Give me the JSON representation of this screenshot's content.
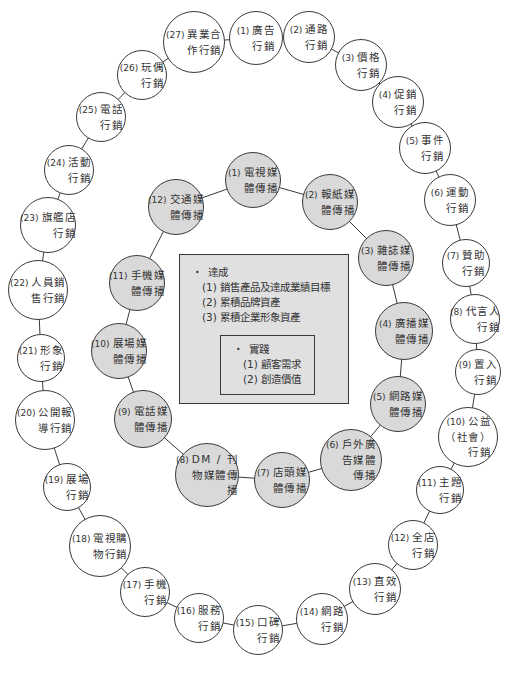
{
  "colors": {
    "line": "#3a3a3a",
    "inner_fill": "#d9d9d9",
    "box_fill": "#e0e0e0",
    "text": "#333333"
  },
  "outer_ring": [
    {
      "num": "(1)",
      "label": "廣告\n行銷",
      "cx": 256,
      "cy": 38,
      "r": 27
    },
    {
      "num": "(2)",
      "label": "通路\n行銷",
      "cx": 309,
      "cy": 37,
      "r": 26
    },
    {
      "num": "(3)",
      "label": "價格\n行銷",
      "cx": 361,
      "cy": 65,
      "r": 26
    },
    {
      "num": "(4)",
      "label": "促銷\n行銷",
      "cx": 398,
      "cy": 102,
      "r": 26
    },
    {
      "num": "(5)",
      "label": "事件\n行銷",
      "cx": 425,
      "cy": 148,
      "r": 26
    },
    {
      "num": "(6)",
      "label": "運動\n行銷",
      "cx": 450,
      "cy": 200,
      "r": 26
    },
    {
      "num": "(7)",
      "label": "贊助\n行銷",
      "cx": 466,
      "cy": 263,
      "r": 24
    },
    {
      "num": "(8)",
      "label": "代言人\n行銷",
      "cx": 475,
      "cy": 319,
      "r": 25
    },
    {
      "num": "(9)",
      "label": "置入\n行銷",
      "cx": 478,
      "cy": 372,
      "r": 23
    },
    {
      "num": "(10)",
      "label": "公益\n（社會）\n行銷",
      "cx": 468,
      "cy": 437,
      "r": 30
    },
    {
      "num": "(11)",
      "label": "主題\n行銷",
      "cx": 440,
      "cy": 490,
      "r": 24
    },
    {
      "num": "(12)",
      "label": "全店\n行銷",
      "cx": 413,
      "cy": 545,
      "r": 25
    },
    {
      "num": "(13)",
      "label": "直效\n行銷",
      "cx": 375,
      "cy": 589,
      "r": 26
    },
    {
      "num": "(14)",
      "label": "網路\n行銷",
      "cx": 322,
      "cy": 619,
      "r": 26
    },
    {
      "num": "(15)",
      "label": "口碑\n行銷",
      "cx": 258,
      "cy": 630,
      "r": 25
    },
    {
      "num": "(16)",
      "label": "服務\n行銷",
      "cx": 199,
      "cy": 618,
      "r": 25
    },
    {
      "num": "(17)",
      "label": "手機\n行銷",
      "cx": 145,
      "cy": 592,
      "r": 25
    },
    {
      "num": "(18)",
      "label": "電視購\n物行銷",
      "cx": 100,
      "cy": 546,
      "r": 31
    },
    {
      "num": "(19)",
      "label": "展場\n行銷",
      "cx": 67,
      "cy": 487,
      "r": 24
    },
    {
      "num": "(20)",
      "label": "公開報\n導行銷",
      "cx": 45,
      "cy": 420,
      "r": 30
    },
    {
      "num": "(21)",
      "label": "形象\n行銷",
      "cx": 41,
      "cy": 358,
      "r": 24
    },
    {
      "num": "(22)",
      "label": "人員銷\n售行銷",
      "cx": 38,
      "cy": 290,
      "r": 30
    },
    {
      "num": "(23)",
      "label": "旗艦店\n行銷",
      "cx": 48,
      "cy": 225,
      "r": 28
    },
    {
      "num": "(24)",
      "label": "活動\n行銷",
      "cx": 69,
      "cy": 170,
      "r": 25
    },
    {
      "num": "(25)",
      "label": "電話\n行銷",
      "cx": 101,
      "cy": 117,
      "r": 25
    },
    {
      "num": "(26)",
      "label": "玩偶\n行銷",
      "cx": 142,
      "cy": 75,
      "r": 25
    },
    {
      "num": "(27)",
      "label": "異業合\n作行銷",
      "cx": 194,
      "cy": 42,
      "r": 31
    }
  ],
  "inner_ring": [
    {
      "num": "(1)",
      "label": "電視媒\n體傳播",
      "cx": 253,
      "cy": 180,
      "r": 28
    },
    {
      "num": "(2)",
      "label": "報紙媒\n體傳播",
      "cx": 330,
      "cy": 202,
      "r": 28
    },
    {
      "num": "(3)",
      "label": "雜誌媒\n體傳播",
      "cx": 386,
      "cy": 258,
      "r": 28
    },
    {
      "num": "(4)",
      "label": "廣播媒\n體傳播",
      "cx": 404,
      "cy": 331,
      "r": 29
    },
    {
      "num": "(5)",
      "label": "網路媒\n體傳播",
      "cx": 398,
      "cy": 404,
      "r": 28
    },
    {
      "num": "(6)",
      "label": "戶外廣\n告媒體\n傳播",
      "cx": 351,
      "cy": 460,
      "r": 31
    },
    {
      "num": "(7)",
      "label": "店頭媒\n體傳播",
      "cx": 282,
      "cy": 480,
      "r": 28
    },
    {
      "num": "(8)",
      "label": "DM / 刊\n物媒體傳\n播",
      "cx": 207,
      "cy": 475,
      "r": 32
    },
    {
      "num": "(9)",
      "label": "電話媒\n體傳播",
      "cx": 143,
      "cy": 419,
      "r": 29
    },
    {
      "num": "(10)",
      "label": "展場媒\n體傳播",
      "cx": 119,
      "cy": 351,
      "r": 28
    },
    {
      "num": "(11)",
      "label": "手機媒\n體傳播",
      "cx": 137,
      "cy": 283,
      "r": 28
    },
    {
      "num": "(12)",
      "label": "交通媒\n體傳播",
      "cx": 176,
      "cy": 207,
      "r": 28
    }
  ],
  "center_box": {
    "heading_bullet": "・",
    "heading": "達成",
    "items": [
      "(1) 銷售產品及達成業績目標",
      "(2) 累積品牌資產",
      "(3) 累積企業形象資產"
    ],
    "inner_box": {
      "heading_bullet": "・",
      "heading": "實踐",
      "items": [
        "(1) 顧客需求",
        "(2) 創造價值"
      ]
    }
  }
}
